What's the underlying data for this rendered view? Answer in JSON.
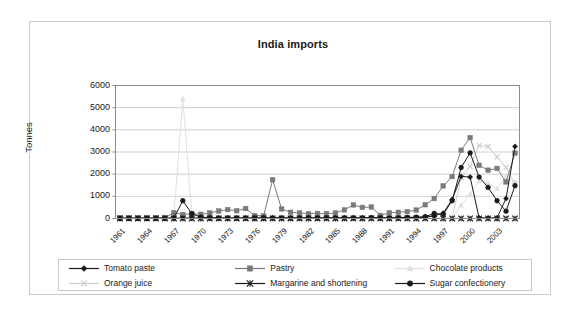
{
  "figure": {
    "title": "India imports",
    "background_color": "#ffffff",
    "frame_color": "#c9c9c9"
  },
  "chart_data": {
    "type": "line",
    "title": "India imports",
    "xlabel": "",
    "ylabel": "Tonnes",
    "ylim": [
      0,
      6000
    ],
    "ytick_values": [
      0,
      1000,
      2000,
      3000,
      4000,
      5000,
      6000
    ],
    "ytick_labels": [
      "0",
      "1000",
      "2000",
      "3000",
      "4000",
      "5000",
      "6000"
    ],
    "xlim": [
      1961,
      2005
    ],
    "xtick_labels": [
      "1961",
      "1964",
      "1967",
      "1970",
      "1973",
      "1976",
      "1979",
      "1982",
      "1985",
      "1988",
      "1991",
      "1994",
      "1997",
      "2000",
      "2003"
    ],
    "x": [
      1961,
      1962,
      1963,
      1964,
      1965,
      1966,
      1967,
      1968,
      1969,
      1970,
      1971,
      1972,
      1973,
      1974,
      1975,
      1976,
      1977,
      1978,
      1979,
      1980,
      1981,
      1982,
      1983,
      1984,
      1985,
      1986,
      1987,
      1988,
      1989,
      1990,
      1991,
      1992,
      1993,
      1994,
      1995,
      1996,
      1997,
      1998,
      1999,
      2000,
      2001,
      2002,
      2003,
      2004,
      2005
    ],
    "grid": true,
    "legend_position": "bottom",
    "series": [
      {
        "name": "Tomato paste",
        "color": "#1a1a1a",
        "marker": "diamond",
        "values": [
          5,
          5,
          5,
          5,
          5,
          5,
          10,
          15,
          20,
          20,
          15,
          10,
          10,
          10,
          10,
          10,
          15,
          20,
          20,
          15,
          15,
          20,
          20,
          20,
          25,
          25,
          25,
          25,
          25,
          20,
          20,
          25,
          30,
          40,
          60,
          120,
          240,
          860,
          1900,
          1870,
          30,
          25,
          30,
          900,
          3250
        ]
      },
      {
        "name": "Pastry",
        "color": "#7a7a7a",
        "marker": "square",
        "values": [
          30,
          30,
          35,
          35,
          40,
          45,
          260,
          180,
          215,
          190,
          250,
          340,
          400,
          350,
          450,
          130,
          120,
          1750,
          430,
          280,
          250,
          220,
          230,
          220,
          250,
          390,
          610,
          500,
          520,
          140,
          260,
          280,
          310,
          380,
          620,
          900,
          1470,
          1890,
          3080,
          3650,
          2400,
          2180,
          2260,
          1650,
          2950
        ]
      },
      {
        "name": "Chocolate products",
        "color": "#e0e0e0",
        "marker": "triangle",
        "values": [
          2,
          2,
          2,
          2,
          2,
          2,
          120,
          5400,
          240,
          5,
          5,
          5,
          5,
          5,
          5,
          5,
          5,
          5,
          5,
          5,
          5,
          5,
          5,
          5,
          5,
          5,
          5,
          5,
          5,
          5,
          5,
          5,
          5,
          5,
          5,
          5,
          10,
          20,
          600,
          1100,
          1700,
          1600,
          1350,
          1900,
          1650
        ]
      },
      {
        "name": "Orange juice",
        "color": "#cfcfcf",
        "marker": "x",
        "values": [
          3,
          3,
          3,
          3,
          3,
          3,
          3,
          60,
          20,
          10,
          5,
          5,
          5,
          5,
          5,
          5,
          5,
          5,
          5,
          5,
          5,
          5,
          5,
          5,
          5,
          5,
          5,
          5,
          5,
          5,
          5,
          5,
          5,
          5,
          5,
          5,
          5,
          10,
          1850,
          2350,
          3290,
          3250,
          2780,
          2300,
          1560
        ]
      },
      {
        "name": "Margarine and shortening",
        "color": "#1a1a1a",
        "marker": "star",
        "values": [
          2,
          2,
          2,
          2,
          2,
          2,
          2,
          2,
          2,
          2,
          2,
          2,
          2,
          2,
          2,
          2,
          2,
          2,
          2,
          2,
          2,
          2,
          2,
          2,
          2,
          2,
          2,
          2,
          2,
          2,
          2,
          2,
          2,
          2,
          2,
          2,
          2,
          2,
          2,
          2,
          2,
          2,
          2,
          2,
          2
        ]
      },
      {
        "name": "Sugar confectionery",
        "color": "#1a1a1a",
        "marker": "circle",
        "values": [
          8,
          8,
          8,
          8,
          8,
          8,
          30,
          800,
          220,
          60,
          40,
          30,
          30,
          30,
          30,
          30,
          30,
          30,
          30,
          30,
          30,
          30,
          30,
          30,
          30,
          30,
          30,
          30,
          40,
          30,
          30,
          40,
          50,
          60,
          80,
          230,
          190,
          800,
          2300,
          2960,
          1870,
          1400,
          800,
          330,
          1480
        ]
      }
    ]
  },
  "legend": {
    "rows": [
      [
        {
          "label": "Tomato paste",
          "marker": "diamond",
          "color": "#1a1a1a"
        },
        {
          "label": "Pastry",
          "marker": "square",
          "color": "#7a7a7a"
        },
        {
          "label": "Chocolate products",
          "marker": "triangle",
          "color": "#e0e0e0"
        }
      ],
      [
        {
          "label": "Orange juice",
          "marker": "x",
          "color": "#cfcfcf"
        },
        {
          "label": "Margarine and shortening",
          "marker": "star",
          "color": "#1a1a1a"
        },
        {
          "label": "Sugar confectionery",
          "marker": "circle",
          "color": "#1a1a1a"
        }
      ]
    ]
  }
}
